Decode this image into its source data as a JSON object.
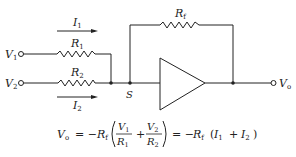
{
  "diagram": {
    "type": "inverting summing amplifier",
    "labels": {
      "v1": {
        "main": "V",
        "sub": "1"
      },
      "v2": {
        "main": "V",
        "sub": "2"
      },
      "vo": {
        "main": "V",
        "sub": "o"
      },
      "r1": {
        "main": "R",
        "sub": "1"
      },
      "r2": {
        "main": "R",
        "sub": "2"
      },
      "rf": {
        "main": "R",
        "sub": "f"
      },
      "i1": {
        "main": "I",
        "sub": "1"
      },
      "i2": {
        "main": "I",
        "sub": "2"
      },
      "s": "S"
    },
    "equation": {
      "lhs_main": "V",
      "lhs_sub": "o",
      "eq1": "= −",
      "rf_main": "R",
      "rf_sub": "f",
      "frac1_num_main": "V",
      "frac1_num_sub": "1",
      "frac1_den_main": "R",
      "frac1_den_sub": "1",
      "plus": "+",
      "frac2_num_main": "V",
      "frac2_num_sub": "2",
      "frac2_den_main": "R",
      "frac2_den_sub": "2",
      "eq2": "= −",
      "rhs_rf_main": "R",
      "rhs_rf_sub": "f",
      "rhs_open": "(",
      "rhs_i1_main": "I",
      "rhs_i1_sub": "1",
      "rhs_plus": "+",
      "rhs_i2_main": "I",
      "rhs_i2_sub": "2",
      "rhs_close": ")"
    },
    "colors": {
      "line": "#222222",
      "background": "#ffffff"
    }
  }
}
